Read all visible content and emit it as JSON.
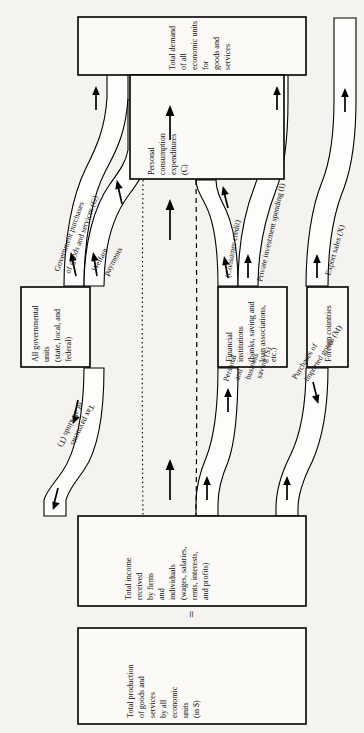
{
  "diagram": {
    "orientation": "rotated-90-ccw",
    "boxes": {
      "total_demand": {
        "name": "total-demand-box",
        "lines": [
          "Total demand",
          "of all",
          "economic units",
          "for",
          "goods and",
          "services"
        ]
      },
      "personal_consumption": {
        "name": "personal-consumption-box",
        "lines": [
          "Personal",
          "consumption",
          "expenditures",
          "(C)"
        ]
      },
      "government": {
        "name": "government-units-box",
        "lines": [
          "All governmental",
          "units",
          "(state, local, and",
          "federal)"
        ]
      },
      "financial": {
        "name": "financial-institutions-box",
        "lines": [
          "Financial",
          "institutions",
          "(banks, saving and",
          "loan associations,",
          "etc.)"
        ]
      },
      "foreign": {
        "name": "foreign-countries-box",
        "lines": [
          "Foreign countries"
        ]
      },
      "total_income": {
        "name": "total-income-box",
        "lines": [
          "Total income",
          "received",
          "by firms",
          "and",
          "individuals",
          "(wages, salaries,",
          "rents, interests,",
          "and profits)"
        ]
      },
      "total_production": {
        "name": "total-production-box",
        "lines": [
          "Total production",
          "of goods and",
          "services",
          "by all",
          "economic",
          "units",
          "(in $)"
        ]
      }
    },
    "flows": {
      "government_purchases": {
        "lines": [
          "Government purchases",
          "of goods and services (G)"
        ]
      },
      "welfare_payments": {
        "lines": [
          "Welfare",
          "payments"
        ]
      },
      "tax_payments": {
        "lines": [
          "Tax payments",
          "of all kinds (T)"
        ]
      },
      "consumer_credit": {
        "lines": [
          "(Consumer credit)"
        ]
      },
      "private_investment": {
        "lines": [
          "Private investment  spending (I)"
        ]
      },
      "export_sales": {
        "lines": [
          "Export sales (X)"
        ]
      },
      "personal_saving": {
        "lines": [
          "Personal",
          "and",
          "business",
          "saving (S)"
        ]
      },
      "imports": {
        "lines": [
          "Purchases of",
          "imported goods (M)"
        ]
      }
    },
    "equals_sign": "=",
    "colors": {
      "line": "#000000",
      "paper": "#f4f3f0",
      "fill": "#fbfaf7"
    }
  }
}
